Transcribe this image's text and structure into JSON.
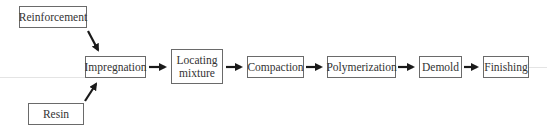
{
  "diagram": {
    "type": "process-flow",
    "inputs": [
      {
        "id": "reinforcement",
        "label": "Reinforcement"
      },
      {
        "id": "resin",
        "label": "Resin"
      }
    ],
    "steps": [
      {
        "id": "impregnation",
        "label": "Impregnation"
      },
      {
        "id": "locating-mixture",
        "label": "Locating\nmixture"
      },
      {
        "id": "compaction",
        "label": "Compaction"
      },
      {
        "id": "polymerization",
        "label": "Polymerization"
      },
      {
        "id": "demold",
        "label": "Demold"
      },
      {
        "id": "finishing",
        "label": "Finishing"
      }
    ],
    "edges": [
      [
        "reinforcement",
        "impregnation"
      ],
      [
        "resin",
        "impregnation"
      ],
      [
        "impregnation",
        "locating-mixture"
      ],
      [
        "locating-mixture",
        "compaction"
      ],
      [
        "compaction",
        "polymerization"
      ],
      [
        "polymerization",
        "demold"
      ],
      [
        "demold",
        "finishing"
      ]
    ],
    "colors": {
      "border": "#6a6a6a",
      "arrow": "#1a1a1a",
      "text": "#333333"
    }
  }
}
